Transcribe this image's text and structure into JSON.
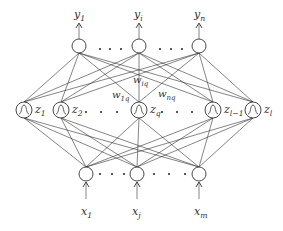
{
  "diagram": {
    "title": "",
    "type": "neural-network",
    "outputs": [
      {
        "id": "y1",
        "base": "y",
        "sub": "1",
        "x": 79
      },
      {
        "id": "yi",
        "base": "y",
        "sub": "i",
        "x": 139
      },
      {
        "id": "yn",
        "base": "y",
        "sub": "n",
        "x": 199
      }
    ],
    "hidden": [
      {
        "id": "z1",
        "base": "z",
        "sub": "1",
        "x": 24
      },
      {
        "id": "z2",
        "base": "z",
        "sub": "2",
        "x": 61
      },
      {
        "id": "zq",
        "base": "z",
        "sub": "q",
        "x": 139
      },
      {
        "id": "zl-1",
        "base": "z",
        "sub": "l−1",
        "x": 213
      },
      {
        "id": "zl",
        "base": "z",
        "sub": "l",
        "x": 253
      }
    ],
    "inputs": [
      {
        "id": "x1",
        "base": "x",
        "sub": "1",
        "x": 86
      },
      {
        "id": "xj",
        "base": "x",
        "sub": "j",
        "x": 137
      },
      {
        "id": "xm",
        "base": "x",
        "sub": "m",
        "x": 199
      }
    ],
    "weights": [
      {
        "base": "w",
        "sub": "1q"
      },
      {
        "base": "w",
        "sub": "iq"
      },
      {
        "base": "w",
        "sub": "nq"
      }
    ],
    "ellipsis": "· · ·"
  }
}
